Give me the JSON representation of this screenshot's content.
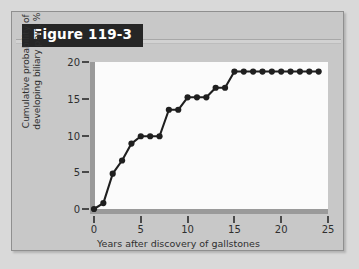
{
  "figure": {
    "banner_title": "Figure 119-3"
  },
  "chart_data": {
    "type": "line",
    "title": "",
    "subtitle": "",
    "xlabel": "Years after discovery of gallstones",
    "ylabel": "Cumulative probability of developing biliary pain, %",
    "xlim": [
      0,
      25
    ],
    "ylim": [
      0,
      20
    ],
    "xticks": [
      0,
      5,
      10,
      15,
      20,
      25
    ],
    "xtick_labels": [
      "0",
      "5",
      "10",
      "15",
      "20",
      "25"
    ],
    "yticks": [
      0,
      5,
      10,
      15,
      20
    ],
    "ytick_labels": [
      "0",
      "5",
      "10",
      "15",
      "20"
    ],
    "grid": false,
    "legend": null,
    "marker": "filled-circle",
    "line_color": "#1f1f1f",
    "marker_color": "#1f1f1f",
    "plot_background": "#fbfbfb",
    "series": [
      {
        "name": "Cumulative probability of biliary pain",
        "x": [
          0,
          1,
          2,
          3,
          4,
          5,
          6,
          7,
          8,
          9,
          10,
          11,
          12,
          13,
          14,
          15,
          16,
          17,
          18,
          19,
          20,
          21,
          22,
          23,
          24
        ],
        "values": [
          0.0,
          0.8,
          4.8,
          6.6,
          8.9,
          9.9,
          9.9,
          9.9,
          13.5,
          13.5,
          15.2,
          15.2,
          15.2,
          16.5,
          16.5,
          18.7,
          18.7,
          18.7,
          18.7,
          18.7,
          18.7,
          18.7,
          18.7,
          18.7,
          18.7
        ]
      }
    ]
  }
}
